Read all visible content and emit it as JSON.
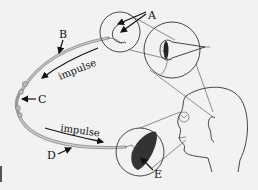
{
  "diagram": {
    "labels": {
      "A": "A",
      "B": "B",
      "C": "C",
      "D": "D",
      "E": "E"
    },
    "impulse_upper": "impulse",
    "impulse_lower": "impulse",
    "colors": {
      "background": "#f2f2f2",
      "line": "#333333",
      "nerve": "#999999",
      "receptor_dark": "#333333"
    }
  }
}
